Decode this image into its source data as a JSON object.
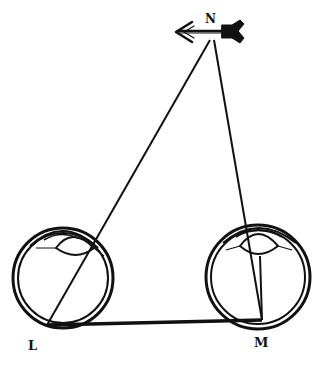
{
  "figure": {
    "colors": {
      "ink": "#111111",
      "background": "#ffffff"
    },
    "labels": {
      "object": "N",
      "left_eye": "L",
      "right_eye": "M"
    },
    "points": {
      "N": [
        212,
        33
      ],
      "L": [
        47,
        325
      ],
      "M": [
        262,
        320
      ]
    },
    "eyes": [
      {
        "name": "left-eye",
        "label": "L",
        "center": [
          63,
          278
        ],
        "radius": 50
      },
      {
        "name": "right-eye",
        "label": "M",
        "center": [
          258,
          277
        ],
        "radius": 52
      }
    ],
    "object_icon": "arrow-icon"
  }
}
